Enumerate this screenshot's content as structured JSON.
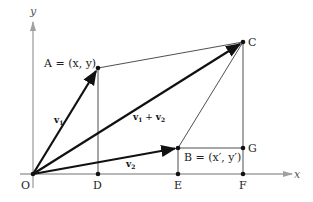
{
  "diagram": {
    "axes": {
      "x_label": "x",
      "y_label": "y",
      "color": "#a0a0a0"
    },
    "points": {
      "O": {
        "label": "O",
        "px": [
          33,
          174
        ]
      },
      "A": {
        "label": "A = (x, y)",
        "px": [
          98,
          68
        ]
      },
      "B": {
        "label": "B = (x′, y′)",
        "px": [
          178,
          148
        ]
      },
      "C": {
        "label": "C",
        "px": [
          243,
          42
        ]
      },
      "D": {
        "label": "D",
        "px": [
          98,
          174
        ]
      },
      "E": {
        "label": "E",
        "px": [
          178,
          174
        ]
      },
      "F": {
        "label": "F",
        "px": [
          243,
          174
        ]
      },
      "G": {
        "label": "G",
        "px": [
          243,
          148
        ]
      }
    },
    "vectors": {
      "v1": {
        "label": "v",
        "sub": "1"
      },
      "v2": {
        "label": "v",
        "sub": "2"
      },
      "sum": {
        "label_a": "v",
        "sub_a": "1",
        "plus": " + ",
        "label_b": "v",
        "sub_b": "2"
      }
    },
    "colors": {
      "line": "#111111",
      "axis": "#a0a0a0"
    }
  }
}
